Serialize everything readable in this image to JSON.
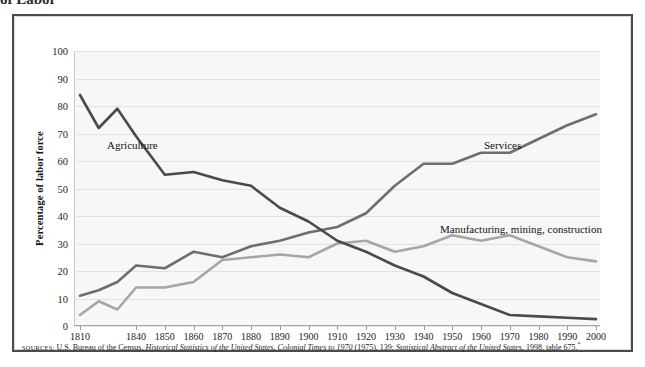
{
  "top_remnant_text": "of Labor",
  "axis": {
    "ylabel": "Percentage of labor force",
    "yticks": [
      0,
      10,
      20,
      30,
      40,
      50,
      60,
      70,
      80,
      90,
      100
    ],
    "ytick_labels": [
      "0",
      "10",
      "20",
      "30",
      "40",
      "50",
      "60",
      "70",
      "80",
      "90",
      "100"
    ],
    "xtick_labels": [
      "1810",
      "1840",
      "1850",
      "1860",
      "1870",
      "1880",
      "1890",
      "1900",
      "1910",
      "1920",
      "1930",
      "1940",
      "1950",
      "1960",
      "1970",
      "1980",
      "1990",
      "2000"
    ]
  },
  "series_labels": {
    "agriculture": "Agriculture",
    "services": "Services",
    "manufacturing": "Manufacturing, mining, construction"
  },
  "source": {
    "prefix": "SOURCES:",
    "part1": " U.S. Bureau of the Census, ",
    "italic1": "Historical Statistics of the United States, Colonial Times to 1970",
    "part2": " (1975), 139; ",
    "italic2": "Statistical Abstract of the United States",
    "part3": ", 1998, table 675."
  },
  "colors": {
    "agriculture": "#4a4a4a",
    "services": "#6e6e6e",
    "manufacturing": "#a6a6a6",
    "plot_bg": "#f7f7f7",
    "grid": "#e2e2e2",
    "frame": "#4b4b4b"
  },
  "chart_data": {
    "type": "line",
    "title": "",
    "xlabel": "",
    "ylabel": "Percentage of labor force",
    "xlim": [
      1810,
      2000
    ],
    "ylim": [
      0,
      100
    ],
    "grid": true,
    "legend_position": "inline-labels",
    "x": [
      1810,
      1820,
      1830,
      1840,
      1850,
      1860,
      1870,
      1880,
      1890,
      1900,
      1910,
      1920,
      1930,
      1940,
      1950,
      1960,
      1970,
      1980,
      1990,
      2000
    ],
    "series": [
      {
        "name": "Agriculture",
        "color": "#4a4a4a",
        "values": [
          84,
          72,
          79,
          69,
          55,
          56,
          53,
          51,
          43,
          38,
          31,
          27,
          22,
          18,
          12,
          8,
          4,
          3.5,
          3,
          2.5
        ]
      },
      {
        "name": "Services",
        "color": "#6e6e6e",
        "values": [
          11,
          13,
          16,
          22,
          21,
          27,
          25,
          29,
          31,
          34,
          36,
          41,
          51,
          59,
          59,
          63,
          63,
          68,
          73,
          77
        ]
      },
      {
        "name": "Manufacturing, mining, construction",
        "color": "#a6a6a6",
        "values": [
          4,
          9,
          6,
          14,
          14,
          16,
          24,
          25,
          26,
          25,
          30,
          31,
          27,
          29,
          33,
          31,
          33,
          29,
          25,
          23.5
        ]
      }
    ],
    "notes": [
      "Agriculture falls from about 84% in 1810 to under 3% in 2000.",
      "Services rises from about 11% in 1810 to about 77% in 2000, crossing agriculture around 1910 near 35%.",
      "Manufacturing, mining and construction rises to a peak of about 33% around 1950-1970 then declines to about 23% in 2000."
    ]
  }
}
